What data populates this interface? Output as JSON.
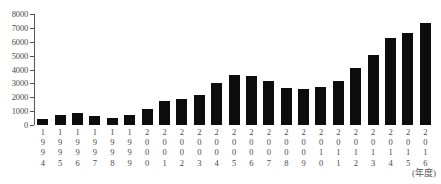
{
  "chart_data": {
    "type": "bar",
    "title": "",
    "subtitle": "",
    "unit_caption": "",
    "xlabel": "(年度)",
    "ylabel": "",
    "ylim": [
      0,
      8000
    ],
    "ytick_step": 1000,
    "yticks": [
      "8000",
      "7000",
      "6000",
      "5000",
      "4000",
      "3000",
      "2000",
      "1000",
      "0"
    ],
    "grid": false,
    "legend": "none",
    "bar_color": "#0d0d0d",
    "categories": [
      "1994",
      "1995",
      "1996",
      "1997",
      "1998",
      "1999",
      "2000",
      "2001",
      "2002",
      "2003",
      "2004",
      "2005",
      "2006",
      "2007",
      "2008",
      "2009",
      "2010",
      "2011",
      "2012",
      "2013",
      "2014",
      "2015",
      "2016"
    ],
    "category_labels_vertical": [
      [
        "1",
        "9",
        "9",
        "4"
      ],
      [
        "1",
        "9",
        "9",
        "5"
      ],
      [
        "1",
        "9",
        "9",
        "6"
      ],
      [
        "1",
        "9",
        "9",
        "7"
      ],
      [
        "1",
        "9",
        "9",
        "8"
      ],
      [
        "1",
        "9",
        "9",
        "9"
      ],
      [
        "2",
        "0",
        "0",
        "0"
      ],
      [
        "2",
        "0",
        "0",
        "1"
      ],
      [
        "2",
        "0",
        "0",
        "2"
      ],
      [
        "2",
        "0",
        "0",
        "3"
      ],
      [
        "2",
        "0",
        "0",
        "4"
      ],
      [
        "2",
        "0",
        "0",
        "5"
      ],
      [
        "2",
        "0",
        "0",
        "6"
      ],
      [
        "2",
        "0",
        "0",
        "7"
      ],
      [
        "2",
        "0",
        "0",
        "8"
      ],
      [
        "2",
        "0",
        "0",
        "9"
      ],
      [
        "2",
        "0",
        "1",
        "0"
      ],
      [
        "2",
        "0",
        "1",
        "1"
      ],
      [
        "2",
        "0",
        "1",
        "2"
      ],
      [
        "2",
        "0",
        "1",
        "3"
      ],
      [
        "2",
        "0",
        "1",
        "4"
      ],
      [
        "2",
        "0",
        "1",
        "5"
      ],
      [
        "2",
        "0",
        "1",
        "6"
      ]
    ],
    "values": [
      420,
      750,
      880,
      660,
      540,
      700,
      1180,
      1700,
      1880,
      2180,
      3000,
      3570,
      3520,
      3200,
      2670,
      2620,
      2720,
      3170,
      4130,
      5020,
      6300,
      6650,
      7330
    ]
  }
}
